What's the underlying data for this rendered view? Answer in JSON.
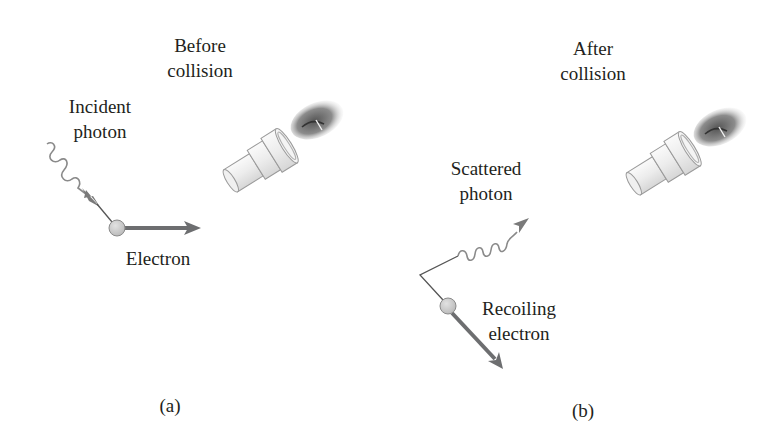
{
  "figure": {
    "panel_a": {
      "title_line1": "Before",
      "title_line2": "collision",
      "incident_label_line1": "Incident",
      "incident_label_line2": "photon",
      "electron_label": "Electron",
      "caption": "(a)"
    },
    "panel_b": {
      "title_line1": "After",
      "title_line2": "collision",
      "scattered_label_line1": "Scattered",
      "scattered_label_line2": "photon",
      "recoil_label_line1": "Recoiling",
      "recoil_label_line2": "electron",
      "caption": "(b)"
    },
    "colors": {
      "text": "#231f20",
      "arrow": "#6d6e70",
      "electron_fill": "#c8c8c8",
      "photon_wave": "#8a8a8a"
    }
  }
}
